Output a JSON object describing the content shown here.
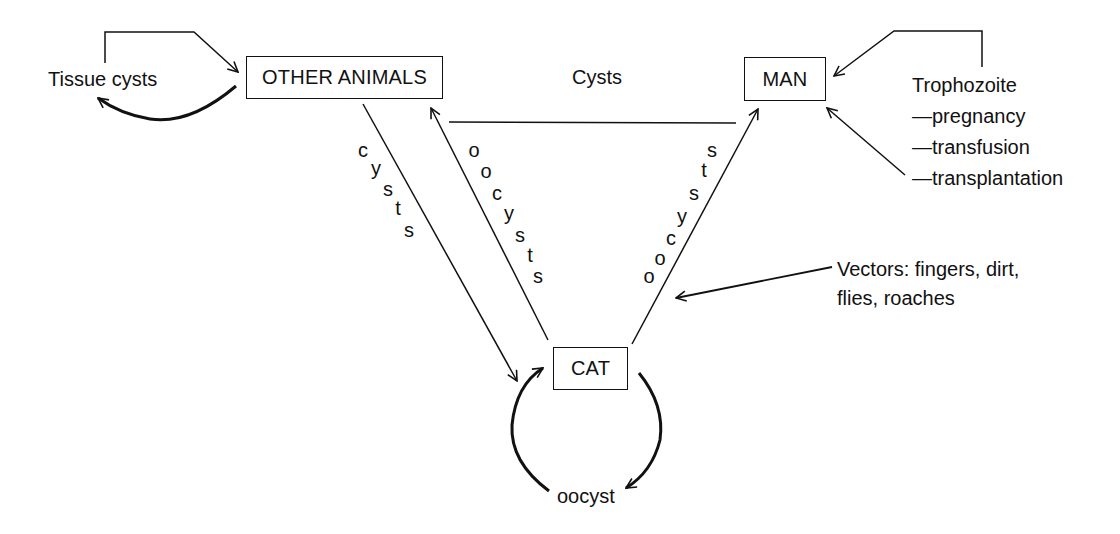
{
  "nodes": {
    "other_animals": "OTHER ANIMALS",
    "man": "MAN",
    "cat": "CAT"
  },
  "labels": {
    "tissue_cysts": "Tissue cysts",
    "cysts_top": "Cysts",
    "oocyst_cycle": "oocyst",
    "trophozoite": {
      "title": "Trophozoite",
      "routes": [
        "—pregnancy",
        "—transfusion",
        "—transplantation"
      ]
    },
    "vectors": {
      "line1": "Vectors: fingers, dirt,",
      "line2": "flies, roaches"
    }
  },
  "edge_labels": {
    "animals_to_cat": [
      "c",
      "y",
      "s",
      "t",
      "s"
    ],
    "cat_to_animals": [
      "o",
      "o",
      "c",
      "y",
      "s",
      "t",
      "s"
    ],
    "cat_to_man": [
      "o",
      "o",
      "c",
      "y",
      "s",
      "t",
      "s"
    ]
  },
  "colors": {
    "stroke": "#111111",
    "background": "#ffffff"
  }
}
